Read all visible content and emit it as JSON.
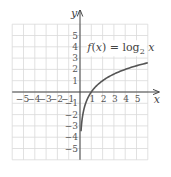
{
  "chart_data": {
    "type": "line",
    "title": "",
    "xlabel": "x",
    "ylabel": "y",
    "xlim": [
      -6,
      6
    ],
    "ylim": [
      -6,
      6
    ],
    "grid": true,
    "x_ticks": [
      -5,
      -4,
      -3,
      -2,
      -1,
      1,
      2,
      3,
      4,
      5
    ],
    "x_tick_labels": [
      "-5",
      "-4",
      "-3",
      "-2",
      "-1",
      "1",
      "2",
      "3",
      "4",
      "5"
    ],
    "y_ticks": [
      5,
      4,
      3,
      2,
      1,
      -1,
      -2,
      -3,
      -4,
      -5
    ],
    "y_tick_labels": [
      "5",
      "4",
      "3",
      "2",
      "1",
      "-1",
      "-2",
      "-3",
      "-4",
      "-5"
    ],
    "annotations": [
      {
        "text_main": "f(x) = log",
        "subscript": "2",
        "text_tail": " x",
        "x": 3.3,
        "y": 3.6
      }
    ],
    "series": [
      {
        "name": "f(x) = log2 x",
        "color": "#555555",
        "x": [
          0.09,
          0.125,
          0.25,
          0.5,
          1,
          2,
          3,
          4,
          5,
          6
        ],
        "y": [
          -3.5,
          -3,
          -2,
          -1,
          0,
          1,
          1.585,
          2,
          2.322,
          2.585
        ]
      }
    ]
  },
  "colors": {
    "grid": "#d9d9d9",
    "axis": "#444444",
    "curve": "#555555",
    "text": "#444444"
  }
}
